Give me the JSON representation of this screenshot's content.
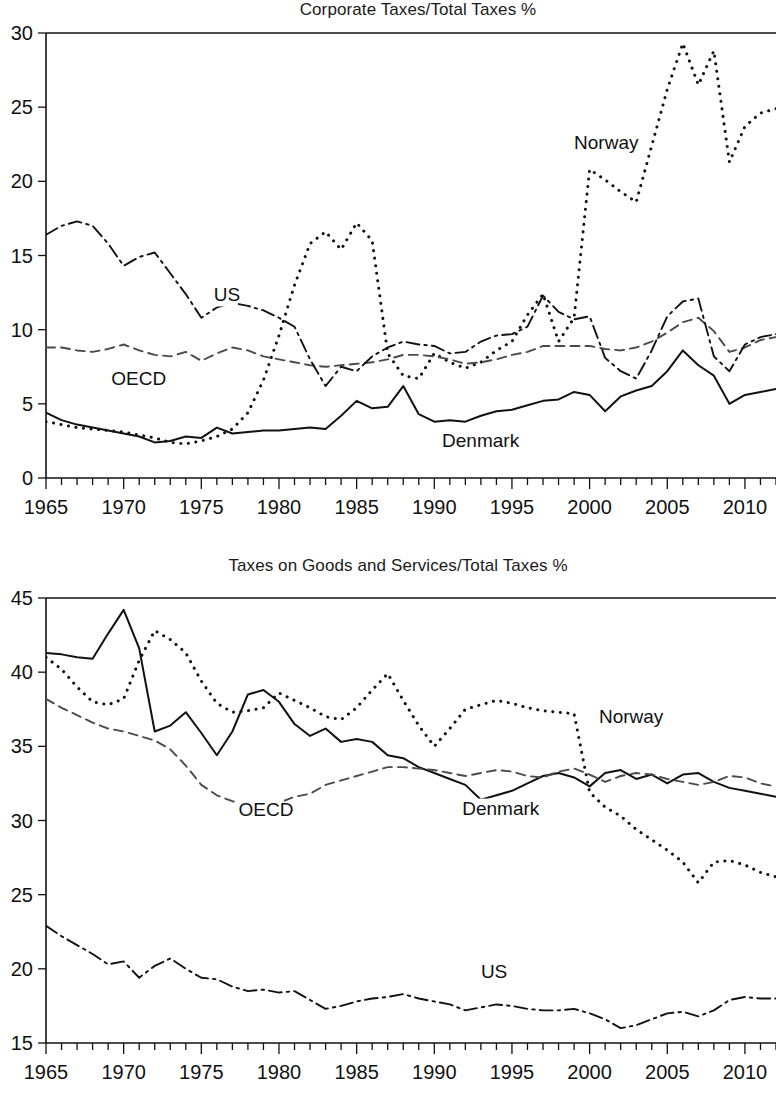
{
  "figure": {
    "width": 776,
    "height": 1094,
    "background": "#ffffff",
    "ink_color": "#111111"
  },
  "panels": [
    {
      "id": "corporate-taxes",
      "title": "Corporate Taxes/Total Taxes %",
      "series_labels": {
        "norway": "Norway",
        "denmark": "Denmark",
        "oecd": "OECD",
        "us": "US"
      }
    },
    {
      "id": "goods-services-taxes",
      "title": "Taxes on Goods and Services/Total Taxes %",
      "series_labels": {
        "norway": "Norway",
        "denmark": "Denmark",
        "oecd": "OECD",
        "us": "US"
      }
    }
  ],
  "chart_data": [
    {
      "type": "line",
      "title": "Corporate Taxes/Total Taxes %",
      "xlabel": "",
      "ylabel": "",
      "xlim": [
        1965,
        2012
      ],
      "ylim": [
        0,
        30
      ],
      "yticks": [
        0,
        5,
        10,
        15,
        20,
        25,
        30
      ],
      "xticks": [
        1965,
        1970,
        1975,
        1980,
        1985,
        1990,
        1995,
        2000,
        2005,
        2010
      ],
      "xtick_minor_step": 1,
      "grid": false,
      "legend": "inline-annotations",
      "x": [
        1965,
        1966,
        1967,
        1968,
        1969,
        1970,
        1971,
        1972,
        1973,
        1974,
        1975,
        1976,
        1977,
        1978,
        1979,
        1980,
        1981,
        1982,
        1983,
        1984,
        1985,
        1986,
        1987,
        1988,
        1989,
        1990,
        1991,
        1992,
        1993,
        1994,
        1995,
        1996,
        1997,
        1998,
        1999,
        2000,
        2001,
        2002,
        2003,
        2004,
        2005,
        2006,
        2007,
        2008,
        2009,
        2010,
        2011,
        2012
      ],
      "series": [
        {
          "name": "Norway",
          "style": "dotted",
          "values": [
            3.8,
            3.6,
            3.4,
            3.3,
            3.2,
            3.1,
            2.9,
            2.7,
            2.4,
            2.3,
            2.5,
            2.8,
            3.3,
            4.4,
            6.6,
            9.6,
            13.0,
            15.8,
            16.6,
            15.4,
            17.2,
            16.0,
            8.4,
            6.9,
            6.7,
            8.4,
            7.8,
            7.4,
            7.8,
            8.6,
            9.2,
            11.0,
            12.4,
            9.2,
            10.8,
            20.8,
            20.1,
            19.3,
            18.6,
            22.4,
            26.2,
            29.3,
            26.5,
            28.8,
            21.3,
            23.7,
            24.6,
            24.9
          ]
        },
        {
          "name": "Denmark",
          "style": "solid",
          "values": [
            4.4,
            3.9,
            3.6,
            3.4,
            3.2,
            3.0,
            2.8,
            2.4,
            2.5,
            2.8,
            2.7,
            3.4,
            3.0,
            3.1,
            3.2,
            3.2,
            3.3,
            3.4,
            3.3,
            4.2,
            5.2,
            4.7,
            4.8,
            6.2,
            4.3,
            3.8,
            3.9,
            3.8,
            4.2,
            4.5,
            4.6,
            4.9,
            5.2,
            5.3,
            5.8,
            5.6,
            4.5,
            5.5,
            5.9,
            6.2,
            7.2,
            8.6,
            7.6,
            6.9,
            5.0,
            5.6,
            5.8,
            6.0
          ]
        },
        {
          "name": "OECD",
          "style": "dashed",
          "values": [
            8.8,
            8.8,
            8.6,
            8.5,
            8.7,
            9.0,
            8.6,
            8.3,
            8.2,
            8.5,
            7.9,
            8.4,
            8.8,
            8.6,
            8.2,
            8.0,
            7.8,
            7.6,
            7.5,
            7.6,
            7.7,
            7.8,
            8.0,
            8.3,
            8.3,
            8.2,
            8.0,
            7.7,
            7.8,
            8.0,
            8.3,
            8.5,
            8.9,
            8.9,
            8.9,
            8.9,
            8.7,
            8.6,
            8.8,
            9.2,
            9.8,
            10.5,
            10.8,
            9.9,
            8.5,
            8.8,
            9.3,
            9.5
          ]
        },
        {
          "name": "US",
          "style": "dashdot",
          "values": [
            16.4,
            17.0,
            17.3,
            17.0,
            15.8,
            14.3,
            14.9,
            15.2,
            13.8,
            12.4,
            10.8,
            11.5,
            11.8,
            11.6,
            11.3,
            10.8,
            10.2,
            8.0,
            6.2,
            7.5,
            7.2,
            8.2,
            8.8,
            9.2,
            9.0,
            8.9,
            8.4,
            8.5,
            9.2,
            9.6,
            9.7,
            10.2,
            12.3,
            11.2,
            10.7,
            10.9,
            8.1,
            7.2,
            6.7,
            8.6,
            10.9,
            11.9,
            12.1,
            8.2,
            7.2,
            9.0,
            9.5,
            9.7
          ]
        }
      ],
      "annotations": [
        {
          "text": "Norway",
          "x": 1999.0,
          "y": 22.2
        },
        {
          "text": "Denmark",
          "x": 1990.5,
          "y": 2.1
        },
        {
          "text": "OECD",
          "x": 1969.2,
          "y": 6.3
        },
        {
          "text": "US",
          "x": 1975.8,
          "y": 11.9
        }
      ]
    },
    {
      "type": "line",
      "title": "Taxes on Goods and Services/Total Taxes %",
      "xlabel": "",
      "ylabel": "",
      "xlim": [
        1965,
        2012
      ],
      "ylim": [
        15,
        45
      ],
      "yticks": [
        15,
        20,
        25,
        30,
        35,
        40,
        45
      ],
      "xticks": [
        1965,
        1970,
        1975,
        1980,
        1985,
        1990,
        1995,
        2000,
        2005,
        2010
      ],
      "xtick_minor_step": 1,
      "grid": false,
      "legend": "inline-annotations",
      "x": [
        1965,
        1966,
        1967,
        1968,
        1969,
        1970,
        1971,
        1972,
        1973,
        1974,
        1975,
        1976,
        1977,
        1978,
        1979,
        1980,
        1981,
        1982,
        1983,
        1984,
        1985,
        1986,
        1987,
        1988,
        1989,
        1990,
        1991,
        1992,
        1993,
        1994,
        1995,
        1996,
        1997,
        1998,
        1999,
        2000,
        2001,
        2002,
        2003,
        2004,
        2005,
        2006,
        2007,
        2008,
        2009,
        2010,
        2011,
        2012
      ],
      "series": [
        {
          "name": "Norway",
          "style": "dotted",
          "values": [
            41.0,
            40.2,
            39.0,
            38.0,
            37.8,
            38.2,
            40.8,
            42.8,
            42.2,
            41.3,
            39.4,
            37.9,
            37.3,
            37.4,
            37.6,
            38.6,
            38.1,
            37.6,
            37.0,
            36.8,
            37.6,
            38.8,
            39.9,
            38.1,
            36.4,
            35.0,
            36.2,
            37.5,
            37.8,
            38.1,
            37.9,
            37.6,
            37.4,
            37.3,
            37.2,
            31.9,
            30.9,
            30.3,
            29.4,
            28.7,
            28.0,
            27.2,
            25.8,
            27.2,
            27.3,
            27.0,
            26.5,
            26.2
          ]
        },
        {
          "name": "Denmark",
          "style": "solid",
          "values": [
            41.3,
            41.2,
            41.0,
            40.9,
            42.6,
            44.2,
            41.6,
            36.0,
            36.4,
            37.3,
            35.9,
            34.4,
            36.0,
            38.5,
            38.8,
            38.0,
            36.5,
            35.7,
            36.2,
            35.3,
            35.5,
            35.3,
            34.4,
            34.2,
            33.6,
            33.2,
            32.8,
            32.4,
            31.4,
            31.7,
            32.0,
            32.5,
            33.0,
            33.2,
            32.9,
            32.3,
            33.2,
            33.4,
            32.8,
            33.1,
            32.5,
            33.1,
            33.2,
            32.6,
            32.2,
            32.0,
            31.8,
            31.6
          ]
        },
        {
          "name": "OECD",
          "style": "dashed",
          "values": [
            38.2,
            37.6,
            37.1,
            36.6,
            36.2,
            36.0,
            35.7,
            35.4,
            34.8,
            33.7,
            32.4,
            31.7,
            31.3,
            31.1,
            31.0,
            31.2,
            31.6,
            31.8,
            32.4,
            32.7,
            33.0,
            33.3,
            33.6,
            33.6,
            33.5,
            33.4,
            33.2,
            33.0,
            33.2,
            33.4,
            33.3,
            33.0,
            32.9,
            33.3,
            33.5,
            33.1,
            32.6,
            33.0,
            33.2,
            33.1,
            32.8,
            32.6,
            32.4,
            32.6,
            33.0,
            32.9,
            32.5,
            32.3
          ]
        },
        {
          "name": "US",
          "style": "dashdot",
          "values": [
            22.9,
            22.2,
            21.6,
            21.0,
            20.3,
            20.5,
            19.4,
            20.2,
            20.7,
            20.0,
            19.4,
            19.3,
            18.8,
            18.5,
            18.6,
            18.4,
            18.5,
            17.9,
            17.3,
            17.5,
            17.8,
            18.0,
            18.1,
            18.3,
            18.0,
            17.8,
            17.6,
            17.2,
            17.4,
            17.6,
            17.5,
            17.3,
            17.2,
            17.2,
            17.3,
            17.0,
            16.6,
            16.0,
            16.2,
            16.6,
            17.0,
            17.1,
            16.8,
            17.2,
            17.9,
            18.1,
            18.0,
            18.0
          ]
        }
      ],
      "annotations": [
        {
          "text": "Norway",
          "x": 2000.6,
          "y": 36.6
        },
        {
          "text": "Denmark",
          "x": 1991.8,
          "y": 30.4
        },
        {
          "text": "OECD",
          "x": 1977.4,
          "y": 30.3
        },
        {
          "text": "US",
          "x": 1993.0,
          "y": 19.4
        }
      ]
    }
  ]
}
